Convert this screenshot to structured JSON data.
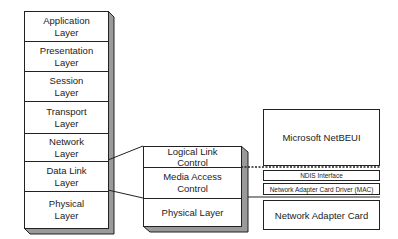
{
  "osi_stack": {
    "layers": [
      {
        "label": "Application Layer"
      },
      {
        "label": "Presentation Layer"
      },
      {
        "label": "Session Layer"
      },
      {
        "label": "Transport Layer"
      },
      {
        "label": "Network Layer"
      },
      {
        "label": "Data Link Layer"
      },
      {
        "label": "Physical Layer"
      }
    ]
  },
  "ieee_stack": {
    "layers": [
      {
        "label": "Logical Link Control"
      },
      {
        "label": "Media Access Control"
      },
      {
        "label": "Physical Layer"
      }
    ]
  },
  "windows_stack": {
    "protocol": "Microsoft NetBEUI",
    "ndis": "NDIS Interface",
    "driver": "Network Adapter Card Driver (MAC)",
    "card": "Network Adapter Card"
  },
  "colors": {
    "line": "#222222",
    "shadow": "#9a9a9a",
    "background": "#ffffff"
  }
}
